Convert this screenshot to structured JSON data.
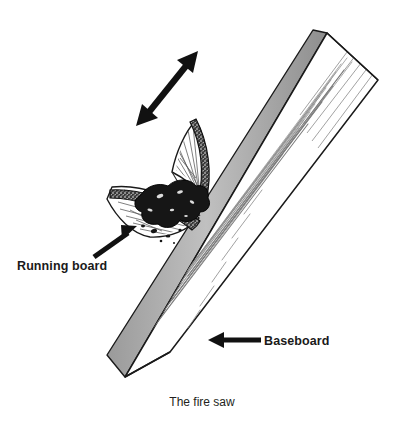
{
  "figure": {
    "title": "The fire saw",
    "caption": "The fire saw",
    "background_color": "#ffffff",
    "ink_color": "#1a1a1a",
    "shade_color": "#a9a9a9",
    "ember_color": "#151515",
    "labels": [
      {
        "id": "running-board",
        "text": "Running board",
        "x": 17,
        "y": 270,
        "anchor": "start"
      },
      {
        "id": "baseboard",
        "text": "Baseboard",
        "x": 264,
        "y": 345,
        "anchor": "start"
      }
    ],
    "annotations": [
      {
        "id": "motion-arrow",
        "kind": "double-headed-arrow",
        "meaning": "back-and-forth sawing motion",
        "from_x": 137,
        "from_y": 125,
        "to_x": 198,
        "to_y": 52
      },
      {
        "id": "running-board-leader",
        "kind": "leader-arrow",
        "meaning": "points to the curved running board",
        "from_x": 95,
        "from_y": 256,
        "to_x": 136,
        "to_y": 227
      },
      {
        "id": "baseboard-leader",
        "kind": "leader-arrow",
        "meaning": "points to the long baseboard plank",
        "from_x": 260,
        "from_y": 340,
        "to_x": 209,
        "to_y": 340
      }
    ],
    "parts": [
      {
        "id": "baseboard",
        "name": "Baseboard",
        "description": "long flat plank running diagonally from lower left to upper right"
      },
      {
        "id": "running-board",
        "name": "Running board",
        "description": "curved board drawn across the baseboard edge at an angle"
      },
      {
        "id": "ember-pile",
        "name": "Ember and dust pile",
        "description": "dark charred dust formed where the two boards cross"
      }
    ]
  }
}
